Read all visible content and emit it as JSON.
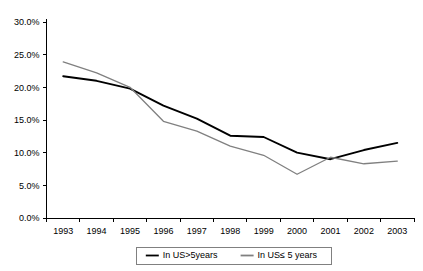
{
  "chart_data": {
    "type": "line",
    "title": "",
    "subtitle": "",
    "xlabel": "",
    "ylabel": "",
    "categories": [
      "1993",
      "1994",
      "1995",
      "1996",
      "1997",
      "1998",
      "1999",
      "2000",
      "2001",
      "2002",
      "2003"
    ],
    "ylim": [
      0,
      30
    ],
    "ytick_labels": [
      "0.0%",
      "5.0%",
      "10.0%",
      "15.0%",
      "20.0%",
      "25.0%",
      "30.0%"
    ],
    "ytick_values": [
      0,
      5,
      10,
      15,
      20,
      25,
      30
    ],
    "grid": false,
    "legend_position": "bottom",
    "series": [
      {
        "name": "In US>5years",
        "color": "#000000",
        "values": [
          21.7,
          21.0,
          19.8,
          17.2,
          15.2,
          12.6,
          12.4,
          10.0,
          9.0,
          10.4,
          11.5
        ]
      },
      {
        "name": "In US≤ 5 years",
        "color": "#808080",
        "values": [
          23.9,
          22.2,
          20.0,
          14.8,
          13.3,
          11.0,
          9.6,
          6.7,
          9.3,
          8.3,
          8.7
        ]
      }
    ]
  },
  "legend": {
    "items": [
      {
        "label": "In US>5years",
        "color": "#000000"
      },
      {
        "label": "In US≤ 5 years",
        "color": "#808080"
      }
    ]
  },
  "axes": {
    "y_labels": [
      "30.0%",
      "25.0%",
      "20.0%",
      "15.0%",
      "10.0%",
      "5.0%",
      "0.0%"
    ],
    "x_labels": [
      "1993",
      "1994",
      "1995",
      "1996",
      "1997",
      "1998",
      "1999",
      "2000",
      "2001",
      "2002",
      "2003"
    ]
  },
  "colors": {
    "series_1": "#000000",
    "series_2": "#808080",
    "axis": "#000000",
    "legend_border": "#808080",
    "background": "#ffffff"
  }
}
